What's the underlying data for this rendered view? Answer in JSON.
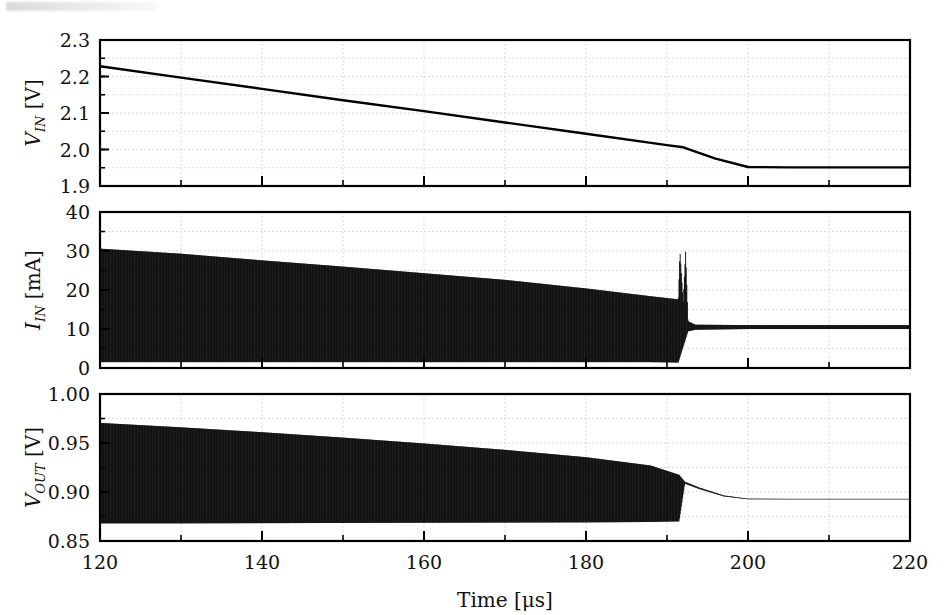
{
  "figure": {
    "type": "multi-panel-timeseries",
    "background": "#ffffff",
    "trace_color": "#000000",
    "grid_color": "#cccccc",
    "axis_color": "#000000",
    "panel_count": 3
  },
  "axes": {
    "x": {
      "label_main": "Time",
      "label_unit": "[μs]",
      "label_full": "Time [μs]",
      "min": 120,
      "max": 220,
      "ticks": [
        120,
        140,
        160,
        180,
        200,
        220
      ],
      "ticklabels": [
        "120",
        "140",
        "160",
        "180",
        "200",
        "220"
      ],
      "minor_tick_step": 10,
      "grid": true
    }
  },
  "chart_data": [
    {
      "type": "line",
      "panel": 1,
      "title": "",
      "xlabel": "",
      "ylabel": "V_IN [V]",
      "ylabel_symbol": "V",
      "ylabel_subscript": "IN",
      "ylabel_unit": "[V]",
      "xlim": [
        120,
        220
      ],
      "ylim": [
        1.9,
        2.3
      ],
      "yticks": [
        1.9,
        2.0,
        2.1,
        2.2,
        2.3
      ],
      "yticklabels": [
        "1.9",
        "2.0",
        "2.1",
        "2.2",
        "2.3"
      ],
      "minor_ytick_step": 0.05,
      "grid": true,
      "legend": "none",
      "series": [
        {
          "name": "V_IN",
          "x": [
            120,
            130,
            140,
            150,
            160,
            170,
            180,
            190,
            192,
            196,
            200,
            205,
            210,
            220
          ],
          "values": [
            2.228,
            2.197,
            2.166,
            2.135,
            2.105,
            2.074,
            2.043,
            2.012,
            2.006,
            1.975,
            1.952,
            1.951,
            1.951,
            1.951
          ]
        }
      ],
      "annotations": [
        "linear discharge ramp from 2.228 V to 1.95 V, flat after ~200 us"
      ]
    },
    {
      "type": "area",
      "panel": 2,
      "title": "",
      "xlabel": "",
      "ylabel": "I_IN [mA]",
      "ylabel_symbol": "I",
      "ylabel_subscript": "IN",
      "ylabel_unit": "[mA]",
      "xlim": [
        120,
        220
      ],
      "ylim": [
        0,
        40
      ],
      "yticks": [
        0,
        10,
        20,
        30,
        40
      ],
      "yticklabels": [
        "0",
        "10",
        "20",
        "30",
        "40"
      ],
      "minor_ytick_step": 5,
      "grid": true,
      "legend": "none",
      "description": "dense switching-ripple band drawn as filled envelope between min and max of each switching cycle",
      "series": [
        {
          "name": "I_IN envelope max",
          "x": [
            120,
            130,
            140,
            150,
            160,
            170,
            180,
            188,
            191.4,
            191.6,
            192.0,
            192.3,
            192.6,
            193.5,
            200,
            210,
            220
          ],
          "values": [
            30.6,
            29.3,
            27.6,
            26.0,
            24.3,
            22.6,
            20.4,
            18.4,
            17.6,
            30.2,
            17.0,
            30.0,
            12.0,
            11.1,
            11.0,
            11.0,
            11.0
          ]
        },
        {
          "name": "I_IN envelope min",
          "x": [
            120,
            130,
            140,
            150,
            160,
            170,
            180,
            188,
            191.4,
            192.6,
            193.5,
            200,
            210,
            220
          ],
          "values": [
            1.5,
            1.5,
            1.5,
            1.5,
            1.5,
            1.5,
            1.5,
            1.5,
            1.4,
            9.4,
            9.8,
            10.0,
            10.0,
            10.0
          ]
        }
      ],
      "annotations": [
        "two narrow current spikes to ~30 mA at t = 192 us",
        "settles to ~10.5 mA average after transition"
      ]
    },
    {
      "type": "area",
      "panel": 3,
      "title": "",
      "xlabel": "Time [μs]",
      "ylabel": "V_OUT [V]",
      "ylabel_symbol": "V",
      "ylabel_subscript": "OUT",
      "ylabel_unit": "[V]",
      "xlim": [
        120,
        220
      ],
      "ylim": [
        0.85,
        1.0
      ],
      "yticks": [
        0.85,
        0.9,
        0.95,
        1.0
      ],
      "yticklabels": [
        "0.85",
        "0.90",
        "0.95",
        "1.00"
      ],
      "minor_ytick_step": 0.025,
      "grid": true,
      "legend": "none",
      "description": "output ripple band narrowing as input droops; ripple collapses at ~192 us then settles",
      "series": [
        {
          "name": "V_OUT envelope max",
          "x": [
            120,
            130,
            140,
            150,
            160,
            170,
            180,
            188,
            191.5,
            192.2,
            194,
            197,
            200,
            205,
            210,
            220
          ],
          "values": [
            0.9705,
            0.966,
            0.961,
            0.9555,
            0.9495,
            0.943,
            0.9355,
            0.927,
            0.9175,
            0.9105,
            0.9045,
            0.8965,
            0.8932,
            0.893,
            0.893,
            0.893
          ]
        },
        {
          "name": "V_OUT envelope min",
          "x": [
            120,
            130,
            140,
            150,
            160,
            170,
            180,
            188,
            191.5,
            192.2,
            194,
            197,
            200,
            205,
            210,
            220
          ],
          "values": [
            0.868,
            0.868,
            0.8682,
            0.8684,
            0.8686,
            0.8688,
            0.869,
            0.8694,
            0.87,
            0.9085,
            0.903,
            0.8955,
            0.8926,
            0.8925,
            0.8925,
            0.8925
          ]
        }
      ],
      "annotations": [
        "peak ~0.91 V at transition, then decays to ~0.893 V steady state"
      ]
    }
  ]
}
